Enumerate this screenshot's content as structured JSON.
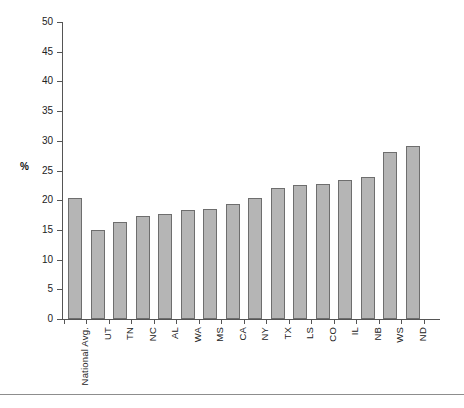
{
  "chart_data": {
    "type": "bar",
    "title": "",
    "subtitle": "",
    "xlabel": "",
    "ylabel": "%",
    "ylim": [
      0,
      50
    ],
    "ytick_step": 5,
    "yticks": [
      0,
      5,
      10,
      15,
      20,
      25,
      30,
      35,
      40,
      45,
      50
    ],
    "grid": false,
    "legend": null,
    "bar_color": "#b5b5b5",
    "bar_border_color": "#6e6e6e",
    "axis_color": "#555555",
    "categories": [
      "National Avg.",
      "UT",
      "TN",
      "NC",
      "AL",
      "WA",
      "MS",
      "CA",
      "NY",
      "TX",
      "LS",
      "CO",
      "IL",
      "NB",
      "WS",
      "ND"
    ],
    "values": [
      20.3,
      15.0,
      16.4,
      17.4,
      17.6,
      18.4,
      18.6,
      19.3,
      20.3,
      22.1,
      22.5,
      22.8,
      23.4,
      23.9,
      28.1,
      29.1
    ]
  }
}
